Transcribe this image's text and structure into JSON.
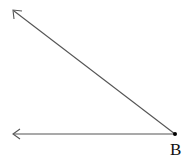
{
  "diagram": {
    "type": "angle",
    "vertex": {
      "label": "B",
      "x": 175,
      "y": 134
    },
    "rays": [
      {
        "name": "upper-ray",
        "end": {
          "x": 13,
          "y": 10
        }
      },
      {
        "name": "lower-ray",
        "end": {
          "x": 13,
          "y": 134
        }
      }
    ],
    "stroke_color": "#555555",
    "point_color": "#000000"
  }
}
